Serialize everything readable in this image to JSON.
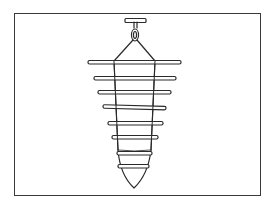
{
  "illustration": {
    "subject": "hanging cone-shaped trap with horizontal rungs",
    "stroke_color": "#2a2a2a",
    "background": "#ffffff",
    "frame": {
      "x": 14,
      "y": 13,
      "width": 247,
      "height": 183
    },
    "hanger_bar": {
      "x": 125,
      "y": 18,
      "width": 21,
      "height": 4
    },
    "rungs": [
      {
        "y": 62,
        "x1": 88,
        "x2": 181
      },
      {
        "y": 78,
        "x1": 94,
        "x2": 176
      },
      {
        "y": 92,
        "x1": 98,
        "x2": 171
      },
      {
        "y": 107,
        "x1": 103,
        "x2": 166
      },
      {
        "y": 123,
        "x1": 108,
        "x2": 163
      },
      {
        "y": 137,
        "x1": 112,
        "x2": 158
      },
      {
        "y": 153,
        "x1": 117,
        "x2": 152
      },
      {
        "y": 166,
        "x1": 118,
        "x2": 149
      }
    ],
    "cone": {
      "top_left": [
        114,
        61
      ],
      "top_right": [
        155,
        61
      ],
      "tip": [
        134,
        188
      ]
    }
  }
}
